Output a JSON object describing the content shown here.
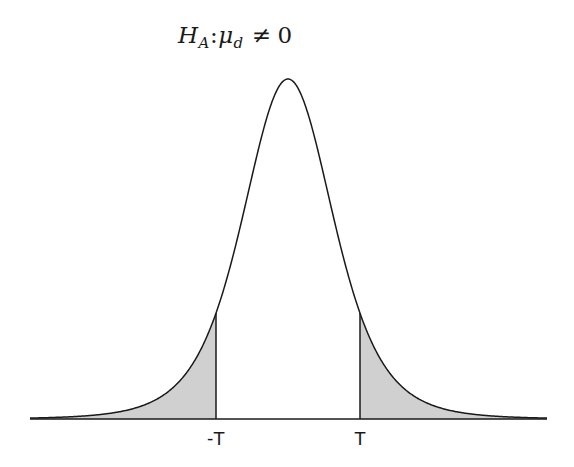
{
  "chart_data": {
    "type": "area",
    "title_parts": {
      "symbol": "H",
      "symbol_sub": "A",
      "separator": ":",
      "param": "μ",
      "param_sub": "d",
      "operator": "≠",
      "value": "0"
    },
    "distribution": "t",
    "degrees_of_freedom_approx": 5,
    "center": 0,
    "critical_values": [
      {
        "label": "-T",
        "position": -1.54
      },
      {
        "label": "T",
        "position": 1.54
      }
    ],
    "shaded_regions": [
      {
        "from": "-inf",
        "to": "-T",
        "color": "#d0d0d0"
      },
      {
        "from": "T",
        "to": "inf",
        "color": "#d0d0d0"
      }
    ],
    "xlabel": "",
    "ylabel": "",
    "xlim": [
      -5.5,
      5.5
    ],
    "grid": false,
    "legend": null
  },
  "labels": {
    "neg_t": "-T",
    "pos_t": "T"
  },
  "style": {
    "line_color": "#1a1a1a",
    "fill_color": "#d0d0d0",
    "background": "#ffffff"
  },
  "layout": {
    "center_px": 288,
    "baseline_px": 419,
    "peak_px": 79,
    "scale_px": 46.7,
    "x_start_px": 30,
    "x_end_px": 547,
    "neg_t_px": 216,
    "pos_t_px": 360
  }
}
